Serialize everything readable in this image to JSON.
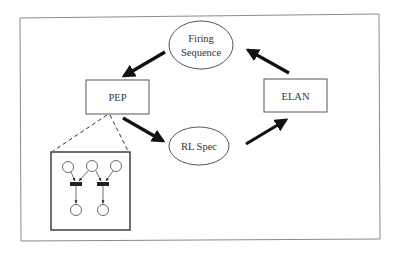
{
  "diagram": {
    "nodes": {
      "firing_sequence": {
        "label_line1": "Firing",
        "label_line2": "Sequence",
        "shape": "ellipse"
      },
      "pep": {
        "label": "PEP",
        "shape": "rectangle"
      },
      "elan": {
        "label": "ELAN",
        "shape": "rectangle"
      },
      "rl_spec": {
        "label": "RL Spec",
        "shape": "ellipse"
      }
    },
    "edges": [
      {
        "from": "Firing Sequence",
        "to": "PEP"
      },
      {
        "from": "PEP",
        "to": "RL Spec"
      },
      {
        "from": "RL Spec",
        "to": "ELAN"
      },
      {
        "from": "ELAN",
        "to": "Firing Sequence"
      }
    ],
    "inset": {
      "description": "Petri net detail of PEP",
      "places_top": 3,
      "transitions": 2,
      "places_bottom": 2
    },
    "colors": {
      "stroke": "#444444",
      "arrow": "#111111",
      "frame": "#888888"
    }
  }
}
